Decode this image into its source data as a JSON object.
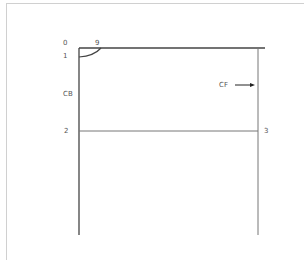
{
  "diagram": {
    "type": "sewing-pattern-draft",
    "points": [
      {
        "id": "0",
        "label": "0"
      },
      {
        "id": "9",
        "label": "9"
      },
      {
        "id": "1",
        "label": "1"
      },
      {
        "id": "2",
        "label": "2"
      },
      {
        "id": "3",
        "label": "3"
      }
    ],
    "annotations": {
      "center_back": "CB",
      "center_front": "CF"
    },
    "colors": {
      "line": "#444444",
      "frame": "#d0d0d0",
      "text": "#555555"
    }
  }
}
